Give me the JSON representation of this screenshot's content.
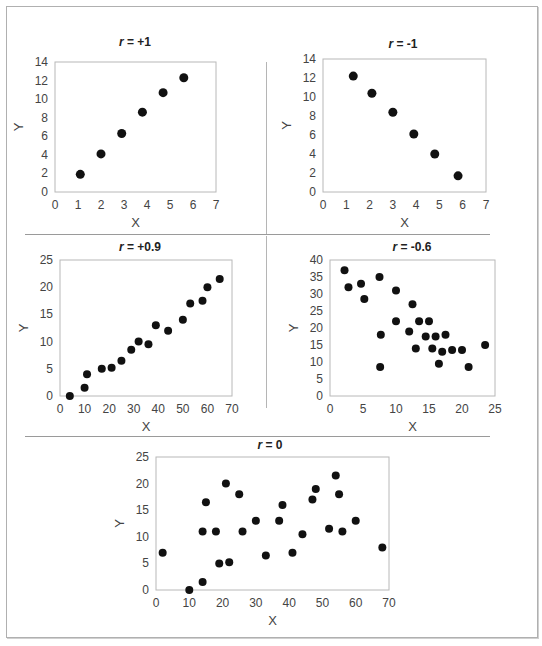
{
  "figure": {
    "panels": [
      {
        "id": "p1",
        "title_var": "r",
        "title_rest": " = +1"
      },
      {
        "id": "p2",
        "title_var": "r",
        "title_rest": " = -1"
      },
      {
        "id": "p3",
        "title_var": "r",
        "title_rest": " = +0.9"
      },
      {
        "id": "p4",
        "title_var": "r",
        "title_rest": " = -0.6"
      },
      {
        "id": "p5",
        "title_var": "r",
        "title_rest": " = 0"
      }
    ]
  },
  "chart_data": [
    {
      "type": "scatter",
      "title": "r = +1",
      "xlabel": "X",
      "ylabel": "Y",
      "xlim": [
        0,
        7
      ],
      "ylim": [
        0,
        14
      ],
      "xticks": [
        0,
        1,
        2,
        3,
        4,
        5,
        6,
        7
      ],
      "yticks": [
        0,
        2,
        4,
        6,
        8,
        10,
        12,
        14
      ],
      "x": [
        1.1,
        2.0,
        2.9,
        3.8,
        4.7,
        5.6
      ],
      "y": [
        1.9,
        4.1,
        6.3,
        8.6,
        10.7,
        12.3
      ],
      "grid": false
    },
    {
      "type": "scatter",
      "title": "r = -1",
      "xlabel": "X",
      "ylabel": "Y",
      "xlim": [
        0,
        7
      ],
      "ylim": [
        0,
        14
      ],
      "xticks": [
        0,
        1,
        2,
        3,
        4,
        5,
        6,
        7
      ],
      "yticks": [
        0,
        2,
        4,
        6,
        8,
        10,
        12,
        14
      ],
      "x": [
        1.3,
        2.1,
        3.0,
        3.9,
        4.8,
        5.8
      ],
      "y": [
        12.2,
        10.4,
        8.4,
        6.1,
        4.0,
        1.7
      ],
      "grid": false
    },
    {
      "type": "scatter",
      "title": "r = +0.9",
      "xlabel": "X",
      "ylabel": "Y",
      "xlim": [
        0,
        70
      ],
      "ylim": [
        0,
        25
      ],
      "xticks": [
        0,
        10,
        20,
        30,
        40,
        50,
        60,
        70
      ],
      "yticks": [
        0,
        5,
        10,
        15,
        20,
        25
      ],
      "x": [
        4,
        10,
        11,
        17,
        21,
        25,
        29,
        32,
        36,
        39,
        44,
        50,
        53,
        58,
        60,
        65
      ],
      "y": [
        0,
        1.5,
        4,
        5,
        5.2,
        6.5,
        8.5,
        10,
        9.5,
        13,
        12,
        14,
        17,
        17.5,
        20,
        21.5
      ],
      "grid": false
    },
    {
      "type": "scatter",
      "title": "r = -0.6",
      "xlabel": "X",
      "ylabel": "Y",
      "xlim": [
        0,
        25
      ],
      "ylim": [
        0,
        40
      ],
      "xticks": [
        0,
        5,
        10,
        15,
        20,
        25
      ],
      "yticks": [
        0,
        5,
        10,
        15,
        20,
        25,
        30,
        35,
        40
      ],
      "x": [
        2.2,
        2.8,
        4.7,
        5.2,
        7.5,
        7.7,
        7.6,
        10,
        10,
        12,
        12.5,
        13,
        13.5,
        14.5,
        15,
        15.5,
        16,
        16.5,
        17,
        17.5,
        18.5,
        20,
        21,
        23.5
      ],
      "y": [
        37,
        32,
        33,
        28.5,
        35,
        18,
        8.5,
        31,
        22,
        19,
        27,
        14,
        22,
        17.5,
        22,
        14,
        17.5,
        9.5,
        13,
        18,
        13.5,
        13.5,
        8.5,
        15
      ],
      "grid": false
    },
    {
      "type": "scatter",
      "title": "r = 0",
      "xlabel": "X",
      "ylabel": "Y",
      "xlim": [
        0,
        70
      ],
      "ylim": [
        0,
        25
      ],
      "xticks": [
        0,
        10,
        20,
        30,
        40,
        50,
        60,
        70
      ],
      "yticks": [
        0,
        5,
        10,
        15,
        20,
        25
      ],
      "x": [
        2,
        10,
        14,
        14,
        15,
        18,
        19,
        21,
        22,
        25,
        26,
        30,
        33,
        37,
        38,
        41,
        44,
        47,
        48,
        52,
        54,
        55,
        56,
        60,
        68
      ],
      "y": [
        7,
        0,
        1.5,
        11,
        16.5,
        11,
        5,
        20,
        5.2,
        18,
        11,
        13,
        6.5,
        13,
        16,
        7,
        10.5,
        17,
        19,
        11.5,
        21.5,
        18,
        11,
        13,
        8
      ],
      "grid": false
    }
  ]
}
